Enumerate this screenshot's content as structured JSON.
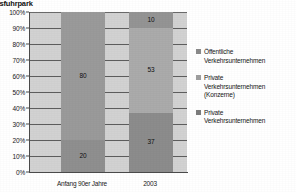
{
  "chart_data": {
    "type": "bar",
    "title": "usfuhrpark",
    "xlabel": "",
    "ylabel": "",
    "ylim": [
      0,
      100
    ],
    "grid": true,
    "stacked": true,
    "normalized_percent": true,
    "legend_position": "right",
    "categories": [
      "Anfang 90er Jahre",
      "2003"
    ],
    "tick_labels": [
      "0%",
      "10%",
      "20%",
      "30%",
      "40%",
      "50%",
      "60%",
      "70%",
      "80%",
      "90%",
      "100%"
    ],
    "series": [
      {
        "name": "Private Verkehrsunternehmen",
        "color": "#8f8f8f",
        "values": [
          20,
          37
        ]
      },
      {
        "name": "Private Verkehrsunternehmen (Konzerne)",
        "color": "#a8a8a8",
        "values": [
          0,
          53
        ]
      },
      {
        "name": "Öffentliche Verkehrsunternehmen",
        "color": "#9a9a9a",
        "values": [
          80,
          10
        ]
      }
    ],
    "bars": [
      {
        "category": "Anfang 90er Jahre",
        "segments": [
          {
            "series": "Private Verkehrsunternehmen",
            "value": 20,
            "label": "20",
            "color": "#8f8f8f"
          },
          {
            "series": "Öffentliche Verkehrsunternehmen",
            "value": 80,
            "label": "80",
            "color": "#9a9a9a"
          }
        ]
      },
      {
        "category": "2003",
        "segments": [
          {
            "series": "Private Verkehrsunternehmen",
            "value": 37,
            "label": "37",
            "color": "#8c8c8c"
          },
          {
            "series": "Private Verkehrsunternehmen (Konzerne)",
            "value": 53,
            "label": "53",
            "color": "#ababab"
          },
          {
            "series": "Öffentliche Verkehrsunternehmen",
            "value": 10,
            "label": "10",
            "color": "#949494"
          }
        ]
      }
    ],
    "legend": [
      {
        "label_line1": "Öffentliche",
        "label_line2": "Verkehrsunternehmen",
        "label_line3": "",
        "color": "#8a8a8a"
      },
      {
        "label_line1": "Private",
        "label_line2": "Verkehrsunternehmen",
        "label_line3": "(Konzerne)",
        "color": "#9e9e9e"
      },
      {
        "label_line1": "Private",
        "label_line2": "Verkehrsunternehmen",
        "label_line3": "",
        "color": "#7c7c7c"
      }
    ],
    "plot_background": "#d2d2d2"
  }
}
